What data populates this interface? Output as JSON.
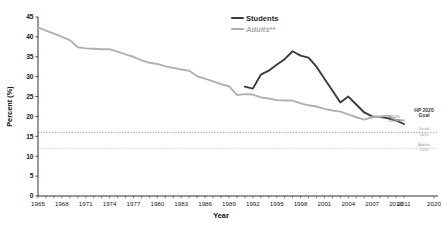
{
  "chart_data": {
    "type": "line",
    "title": "",
    "xlabel": "Year",
    "ylabel": "Percent (%)",
    "ylim": [
      0,
      45
    ],
    "ytick_values": [
      0,
      5,
      10,
      15,
      20,
      25,
      30,
      35,
      40,
      45
    ],
    "xlim": [
      1965,
      2020
    ],
    "xtick_labels": [
      "1965",
      "1968",
      "1971",
      "1974",
      "1977",
      "1980",
      "1983",
      "1986",
      "1989",
      "1992",
      "1995",
      "1998",
      "2001",
      "2004",
      "2007",
      "2010",
      "2011",
      "2020"
    ],
    "grid": false,
    "legend_position": "top-center-right",
    "series": [
      {
        "name": "Students",
        "color": "#3b3b3b",
        "x": [
          1991,
          1992,
          1993,
          1994,
          1995,
          1996,
          1997,
          1998,
          1999,
          2000,
          2001,
          2002,
          2003,
          2004,
          2005,
          2006,
          2007,
          2008,
          2009,
          2010,
          2011
        ],
        "values": [
          27.5,
          27.0,
          30.5,
          31.5,
          33.0,
          34.4,
          36.4,
          35.3,
          34.8,
          32.5,
          29.5,
          26.5,
          23.5,
          25.0,
          23.0,
          21.0,
          20.0,
          19.9,
          19.5,
          19.0,
          18.1
        ]
      },
      {
        "name": "Adults**",
        "color": "#b0b0b0",
        "x": [
          1965,
          1966,
          1967,
          1968,
          1969,
          1970,
          1971,
          1972,
          1973,
          1974,
          1975,
          1976,
          1977,
          1978,
          1979,
          1980,
          1981,
          1982,
          1983,
          1984,
          1985,
          1986,
          1987,
          1988,
          1989,
          1990,
          1991,
          1992,
          1993,
          1994,
          1995,
          1996,
          1997,
          1998,
          1999,
          2000,
          2001,
          2002,
          2003,
          2004,
          2005,
          2006,
          2007,
          2008,
          2009,
          2010,
          2011
        ],
        "values": [
          42.4,
          41.6,
          40.8,
          40.0,
          39.2,
          37.4,
          37.1,
          37.0,
          36.9,
          36.9,
          36.3,
          35.6,
          35.0,
          34.1,
          33.5,
          33.2,
          32.6,
          32.2,
          31.8,
          31.5,
          30.1,
          29.5,
          28.8,
          28.1,
          27.6,
          25.4,
          25.6,
          25.5,
          24.8,
          24.5,
          24.1,
          24.0,
          24.0,
          23.3,
          22.8,
          22.5,
          21.9,
          21.5,
          21.2,
          20.5,
          19.8,
          19.2,
          19.8,
          20.0,
          20.2,
          19.1,
          19.0
        ]
      }
    ],
    "reference_lines": [
      {
        "name": "youth-goal",
        "value": 16,
        "label_title": "HP 2020",
        "label_title2": "Goal",
        "label_group": "Youth",
        "label_value": "16%",
        "style": "dotted",
        "color": "#9d9d9d"
      },
      {
        "name": "adults-goal",
        "value": 12,
        "label_group": "Adults",
        "label_value": "12%",
        "style": "dotted",
        "color": "#c9c9c9"
      }
    ],
    "annotations": [
      {
        "name": "students-end-label",
        "text": "18.1%",
        "x": 2011,
        "y": 18.1
      },
      {
        "name": "adults-end-label",
        "text": "19.0%",
        "x": 2011,
        "y": 19.0
      }
    ],
    "legend": [
      {
        "name": "Students",
        "color": "#3b3b3b"
      },
      {
        "name": "Adults**",
        "color": "#b0b0b0"
      }
    ]
  }
}
